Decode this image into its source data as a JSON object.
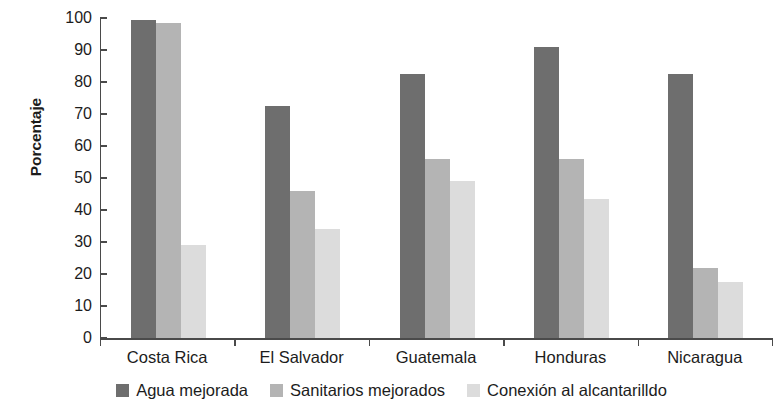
{
  "chart_data": {
    "type": "bar",
    "title": "",
    "subtitle": "",
    "xlabel": "",
    "ylabel": "Porcentaje",
    "ylim": [
      0,
      100
    ],
    "ytick_step": 10,
    "ytick_labels": [
      "100",
      "90",
      "80",
      "70",
      "60",
      "50",
      "40",
      "30",
      "20",
      "10",
      "0"
    ],
    "grid": false,
    "legend_position": "bottom",
    "categories": [
      "Costa Rica",
      "El Salvador",
      "Guatemala",
      "Honduras",
      "Nicaragua"
    ],
    "series": [
      {
        "name": "Agua mejorada",
        "color": "#6e6e6e",
        "values": [
          99.5,
          72.5,
          82.5,
          91,
          82.5
        ]
      },
      {
        "name": "Sanitarios mejorados",
        "color": "#b4b4b4",
        "values": [
          98.5,
          46,
          56,
          56,
          22
        ]
      },
      {
        "name": "Conexión al alcantarilldo",
        "color": "#dcdcdc",
        "values": [
          29,
          34,
          49,
          43.5,
          17.5
        ]
      }
    ]
  },
  "axis": {
    "y_title": "Porcentaje"
  },
  "legend": {
    "items": [
      {
        "label": "Agua mejorada",
        "color": "#6e6e6e"
      },
      {
        "label": "Sanitarios mejorados",
        "color": "#b4b4b4"
      },
      {
        "label": "Conexión al alcantarilldo",
        "color": "#dcdcdc"
      }
    ]
  }
}
